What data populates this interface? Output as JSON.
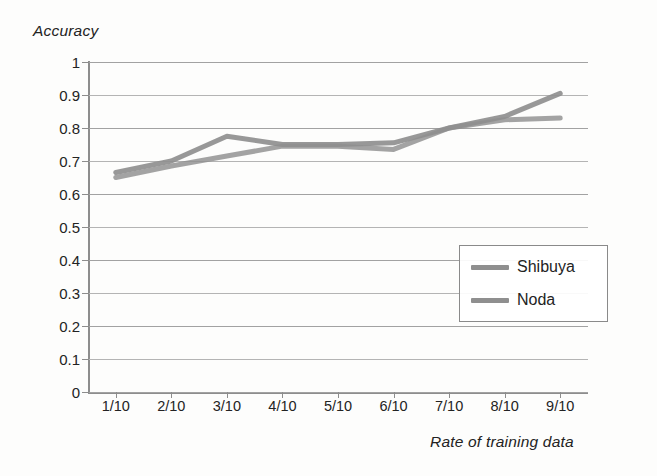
{
  "chart_data": {
    "type": "line",
    "title": "",
    "xlabel": "Rate of training data",
    "ylabel": "Accuracy",
    "categories": [
      "1/10",
      "2/10",
      "3/10",
      "4/10",
      "5/10",
      "6/10",
      "7/10",
      "8/10",
      "9/10"
    ],
    "ylim": [
      0,
      1
    ],
    "ytick_labels": [
      "1",
      "0.9",
      "0.8",
      "0.7",
      "0.6",
      "0.5",
      "0.4",
      "0.3",
      "0.2",
      "0.1",
      "0"
    ],
    "ytick_values": [
      1,
      0.9,
      0.8,
      0.7,
      0.6,
      0.5,
      0.4,
      0.3,
      0.2,
      0.1,
      0
    ],
    "grid": true,
    "legend_position": "center-right",
    "series": [
      {
        "name": "Shibuya",
        "color": "#8f8f8f",
        "values": [
          0.665,
          0.7,
          0.775,
          0.75,
          0.75,
          0.755,
          0.8,
          0.835,
          0.905
        ]
      },
      {
        "name": "Noda",
        "color": "#8f8f8f",
        "values": [
          0.65,
          0.685,
          0.715,
          0.745,
          0.745,
          0.735,
          0.8,
          0.825,
          0.83
        ]
      }
    ]
  },
  "legend": {
    "entries": [
      {
        "label": "Shibuya"
      },
      {
        "label": "Noda"
      }
    ]
  },
  "colors": {
    "series_line": "#8f8f8f",
    "gridline": "#a2a2a2",
    "axis": "#8d8d8d",
    "text": "#232323",
    "background": "#fdfdfc"
  }
}
